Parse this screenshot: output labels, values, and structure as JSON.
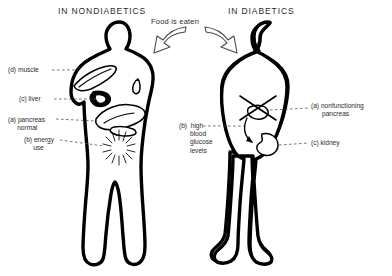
{
  "diagram": {
    "panels": [
      {
        "id": "nondiabetics",
        "title": "IN NONDIABETICS"
      },
      {
        "id": "diabetics",
        "title": "IN DIABETICS"
      }
    ],
    "center_caption": "Food is eaten",
    "labels": {
      "muscle": "(d) muscle",
      "liver": "(c) liver",
      "pancreas_normal": "(a) pancreas\n     normal",
      "energy_use": "(b) energy\n     use",
      "high_glucose": "(b)  high\n      blood\n      glucose\n      levels",
      "nonfunctioning_pancreas": "(a) nonfunctioning\n      pancreas",
      "kidney": "(c) kidney"
    },
    "colors": {
      "ink": "#000000",
      "text": "#2b2b2b",
      "leader": "#555555",
      "background": "#ffffff",
      "arrow_stroke": "#4a4a4a"
    },
    "icons": {
      "food_arrow_left": "curved-arrow-left-icon",
      "food_arrow_right": "curved-arrow-right-icon",
      "energy_burst": "starburst-icon",
      "pancreas_crossed": "x-cross-icon",
      "glucose_flow": "curved-flow-arrow-icon"
    }
  }
}
